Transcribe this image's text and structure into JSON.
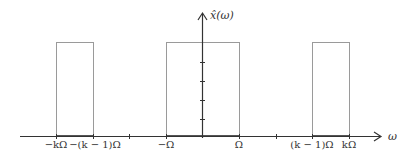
{
  "diagram": {
    "y_axis_label": "x̂(ω)",
    "x_axis_label": "ω",
    "x_tick_labels": [
      {
        "text": "−kΩ",
        "x": 56
      },
      {
        "text": "−(k − 1)Ω",
        "x": 93
      },
      {
        "text": "−Ω",
        "x": 166
      },
      {
        "text": "Ω",
        "x": 239
      },
      {
        "text": "(k − 1)Ω",
        "x": 312
      },
      {
        "text": "kΩ",
        "x": 349
      }
    ],
    "rectangles": [
      {
        "name": "left-band",
        "from": "−kΩ",
        "to": "−(k − 1)Ω"
      },
      {
        "name": "center-band",
        "from": "−Ω",
        "to": "Ω"
      },
      {
        "name": "right-band",
        "from": "(k − 1)Ω",
        "to": "kΩ"
      }
    ],
    "colors": {
      "axis": "#333333",
      "rect_stroke": "#9a9a9a",
      "text": "#333333"
    }
  }
}
